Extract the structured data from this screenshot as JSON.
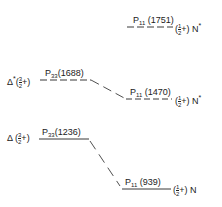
{
  "diagram": {
    "levels": [
      {
        "id": "n1751",
        "state": "P",
        "sub": "11",
        "mass": "(1751)",
        "jp_num": "1",
        "jp_den": "2",
        "parity": "+",
        "particle": "N",
        "star": "*",
        "line": "dashed"
      },
      {
        "id": "d1688",
        "state": "P",
        "sub": "33",
        "mass": "(1688)",
        "jp_num": "3",
        "jp_den": "2",
        "parity": "+",
        "particle": "Δ",
        "star": "*",
        "line": "dashed"
      },
      {
        "id": "n1470",
        "state": "P",
        "sub": "11",
        "mass": "(1470)",
        "jp_num": "1",
        "jp_den": "2",
        "parity": "+",
        "particle": "N",
        "star": "*",
        "line": "dashed"
      },
      {
        "id": "d1236",
        "state": "P",
        "sub": "33",
        "mass": "(1236)",
        "jp_num": "3",
        "jp_den": "2",
        "parity": "+",
        "particle": "Δ",
        "star": "",
        "line": "solid"
      },
      {
        "id": "n939",
        "state": "P",
        "sub": "11",
        "mass": "(939)",
        "jp_num": "1",
        "jp_den": "2",
        "parity": "+",
        "particle": "N",
        "star": "",
        "line": "solid"
      }
    ],
    "connections": [
      {
        "from": "d1688",
        "to": "n1470",
        "style": "dashed"
      },
      {
        "from": "d1236",
        "to": "n939",
        "style": "dashed"
      }
    ]
  }
}
